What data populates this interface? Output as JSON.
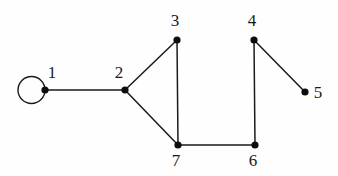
{
  "diagram": {
    "background_color": "#fefefe",
    "stroke_color": "#1a1a1a",
    "vertex_fill": "#0d0d0d",
    "vertex_radius": 3.6,
    "edge_width": 1.5,
    "loop": {
      "name": "self-loop-vertex-1",
      "center_x": 31.5,
      "center_y": 90,
      "radius": 13.5,
      "stroke_width": 1.4
    },
    "vertices": [
      {
        "id": "1",
        "label": "1",
        "x": 45,
        "y": 90,
        "label_x": 52,
        "label_y": 64
      },
      {
        "id": "2",
        "label": "2",
        "x": 125,
        "y": 90,
        "label_x": 119,
        "label_y": 64
      },
      {
        "id": "3",
        "label": "3",
        "x": 177,
        "y": 40,
        "label_x": 175,
        "label_y": 12
      },
      {
        "id": "4",
        "label": "4",
        "x": 254,
        "y": 40,
        "label_x": 252,
        "label_y": 12
      },
      {
        "id": "5",
        "label": "5",
        "x": 305,
        "y": 92,
        "label_x": 318,
        "label_y": 84
      },
      {
        "id": "6",
        "label": "6",
        "x": 255,
        "y": 145,
        "label_x": 253,
        "label_y": 152
      },
      {
        "id": "7",
        "label": "7",
        "x": 178,
        "y": 145,
        "label_x": 176,
        "label_y": 152
      }
    ],
    "edges": [
      {
        "name": "edge-1-2",
        "from": "1",
        "to": "2",
        "x1": 45,
        "y1": 90,
        "x2": 125,
        "y2": 90
      },
      {
        "name": "edge-2-3",
        "from": "2",
        "to": "3",
        "x1": 125,
        "y1": 90,
        "x2": 177,
        "y2": 40
      },
      {
        "name": "edge-2-7",
        "from": "2",
        "to": "7",
        "x1": 125,
        "y1": 90,
        "x2": 178,
        "y2": 145
      },
      {
        "name": "edge-3-7",
        "from": "3",
        "to": "7",
        "x1": 177,
        "y1": 40,
        "x2": 178,
        "y2": 145
      },
      {
        "name": "edge-7-6",
        "from": "7",
        "to": "6",
        "x1": 178,
        "y1": 145,
        "x2": 255,
        "y2": 145
      },
      {
        "name": "edge-6-4",
        "from": "6",
        "to": "4",
        "x1": 255,
        "y1": 145,
        "x2": 254,
        "y2": 40
      },
      {
        "name": "edge-4-5",
        "from": "4",
        "to": "5",
        "x1": 254,
        "y1": 40,
        "x2": 305,
        "y2": 92
      },
      {
        "name": "edge-1-1-loop",
        "from": "1",
        "to": "1",
        "x1": 45,
        "y1": 90,
        "x2": 45,
        "y2": 90
      }
    ]
  }
}
